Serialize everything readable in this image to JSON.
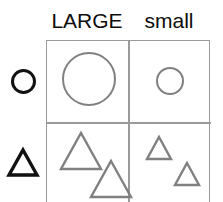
{
  "diagram": {
    "type": "2x2-feature-matrix",
    "background_color": "#ffffff",
    "shape_outline_color": "#808080",
    "label_color": "#111111",
    "grid_line_color": "#9a9a9a"
  },
  "columns": [
    {
      "id": "large",
      "label": "LARGE",
      "size": "large"
    },
    {
      "id": "small",
      "label": "small",
      "size": "small"
    }
  ],
  "rows": [
    {
      "id": "circle",
      "icon": "circle-icon",
      "shape": "circle"
    },
    {
      "id": "triangle",
      "icon": "triangle-icon",
      "shape": "triangle"
    }
  ],
  "cells": [
    {
      "id": "large-circle",
      "row": "circle",
      "column": "large",
      "shape": "circle",
      "size": "large",
      "count": 1,
      "color": "#808080"
    },
    {
      "id": "small-circle",
      "row": "circle",
      "column": "small",
      "shape": "circle",
      "size": "small",
      "count": 1,
      "color": "#808080"
    },
    {
      "id": "large-triangle",
      "row": "triangle",
      "column": "large",
      "shape": "triangle",
      "size": "large",
      "count": 2,
      "color": "#808080"
    },
    {
      "id": "small-triangle",
      "row": "triangle",
      "column": "small",
      "shape": "triangle",
      "size": "small",
      "count": 2,
      "color": "#808080"
    }
  ]
}
